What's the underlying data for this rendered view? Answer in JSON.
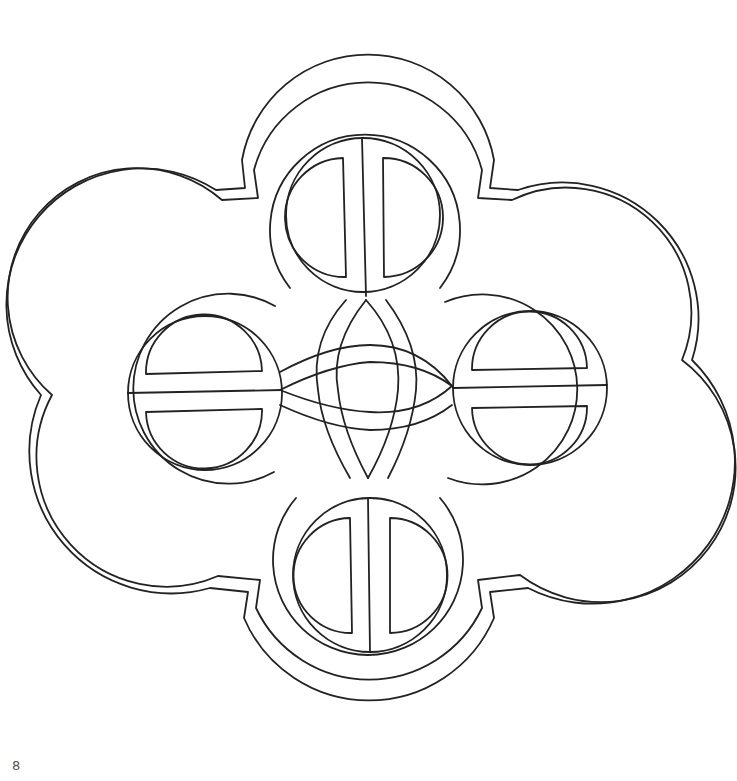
{
  "page": {
    "number": "8",
    "background": "#ffffff",
    "line_color": "#222222"
  },
  "artwork": {
    "subject": "celtic-knot-quatrefoil-line-art",
    "lobes": [
      "top",
      "right",
      "bottom",
      "left"
    ],
    "style": "outline coloring-page"
  }
}
